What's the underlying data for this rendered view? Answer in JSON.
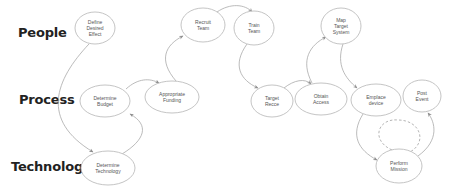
{
  "lanes": [
    {
      "id": "people",
      "label": "People"
    },
    {
      "id": "process",
      "label": "Process"
    },
    {
      "id": "technology",
      "label": "Technology"
    }
  ],
  "nodes": [
    {
      "id": "define-desired-effect",
      "lane": "people",
      "lines": [
        "Define",
        "Desired",
        "Effect"
      ]
    },
    {
      "id": "recruit-team",
      "lane": "people",
      "lines": [
        "Recruit",
        "Team"
      ]
    },
    {
      "id": "train-team",
      "lane": "people",
      "lines": [
        "Train",
        "Team"
      ]
    },
    {
      "id": "map-target-system",
      "lane": "people",
      "lines": [
        "Map",
        "Target",
        "System"
      ]
    },
    {
      "id": "determine-budget",
      "lane": "process",
      "lines": [
        "Determine",
        "Budget"
      ]
    },
    {
      "id": "appropriate-funding",
      "lane": "process",
      "lines": [
        "Appropriate",
        "Funding"
      ]
    },
    {
      "id": "target-recce",
      "lane": "process",
      "lines": [
        "Target",
        "Recce"
      ]
    },
    {
      "id": "obtain-access",
      "lane": "process",
      "lines": [
        "Obtain",
        "Access"
      ]
    },
    {
      "id": "emplace-device",
      "lane": "process",
      "lines": [
        "Emplace",
        "device"
      ]
    },
    {
      "id": "post-event",
      "lane": "process",
      "lines": [
        "Post",
        "Event"
      ]
    },
    {
      "id": "determine-technology",
      "lane": "technology",
      "lines": [
        "Determine",
        "Technology"
      ]
    },
    {
      "id": "perform-mission",
      "lane": "technology",
      "lines": [
        "Perform",
        "Mission"
      ]
    }
  ],
  "edges": [
    {
      "from": "define-desired-effect",
      "to": "determine-technology",
      "style": "solid"
    },
    {
      "from": "determine-technology",
      "to": "determine-budget",
      "style": "solid"
    },
    {
      "from": "determine-budget",
      "to": "appropriate-funding",
      "style": "solid"
    },
    {
      "from": "appropriate-funding",
      "to": "recruit-team",
      "style": "solid"
    },
    {
      "from": "recruit-team",
      "to": "train-team",
      "style": "solid"
    },
    {
      "from": "train-team",
      "to": "target-recce",
      "style": "solid"
    },
    {
      "from": "target-recce",
      "to": "obtain-access",
      "style": "solid"
    },
    {
      "from": "obtain-access",
      "to": "map-target-system",
      "style": "solid"
    },
    {
      "from": "map-target-system",
      "to": "emplace-device",
      "style": "solid"
    },
    {
      "from": "emplace-device",
      "to": "perform-mission",
      "style": "solid"
    },
    {
      "from": "perform-mission",
      "to": "perform-mission",
      "style": "dashed"
    },
    {
      "from": "perform-mission",
      "to": "post-event",
      "style": "solid"
    }
  ]
}
